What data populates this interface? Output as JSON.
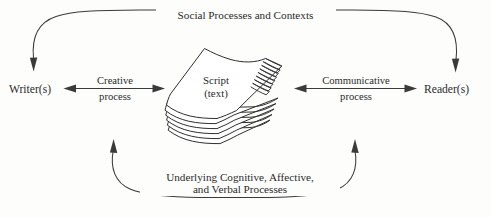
{
  "diagram": {
    "background_color": "#fdfdfc",
    "ink_color": "#2b2b2b",
    "line_color": "#3a3a3a",
    "nodes": {
      "writer": "Writer(s)",
      "reader": "Reader(s)",
      "script_line1": "Script",
      "script_line2": "(text)"
    },
    "arcs": {
      "top_label": "Social Processes and Contexts",
      "bottom_label_line1": "Underlying Cognitive, Affective,",
      "bottom_label_line2": "and Verbal Processes"
    },
    "connectors": {
      "left_label_line1": "Creative",
      "left_label_line2": "process",
      "right_label_line1": "Communicative",
      "right_label_line2": "process"
    },
    "icons": {
      "paper_stack": "paper-stack-icon",
      "arrowhead": "arrowhead-icon"
    }
  }
}
